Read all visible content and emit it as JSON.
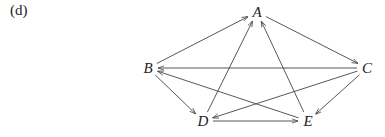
{
  "panel_label": "(d)",
  "graph": {
    "type": "directed",
    "nodes": [
      {
        "id": "A",
        "label": "A",
        "x": 257,
        "y": 17
      },
      {
        "id": "B",
        "label": "B",
        "x": 148,
        "y": 73
      },
      {
        "id": "C",
        "label": "C",
        "x": 367,
        "y": 73
      },
      {
        "id": "D",
        "label": "D",
        "x": 203,
        "y": 126
      },
      {
        "id": "E",
        "label": "E",
        "x": 308,
        "y": 126
      }
    ],
    "edges": [
      {
        "from": "B",
        "to": "A"
      },
      {
        "from": "A",
        "to": "C"
      },
      {
        "from": "C",
        "to": "B"
      },
      {
        "from": "E",
        "to": "B"
      },
      {
        "from": "B",
        "to": "D"
      },
      {
        "from": "D",
        "to": "A"
      },
      {
        "from": "E",
        "to": "A"
      },
      {
        "from": "C",
        "to": "D"
      },
      {
        "from": "C",
        "to": "E"
      },
      {
        "from": "D",
        "to": "E"
      }
    ]
  },
  "colors": {
    "edge": "#444444",
    "text": "#222222"
  }
}
